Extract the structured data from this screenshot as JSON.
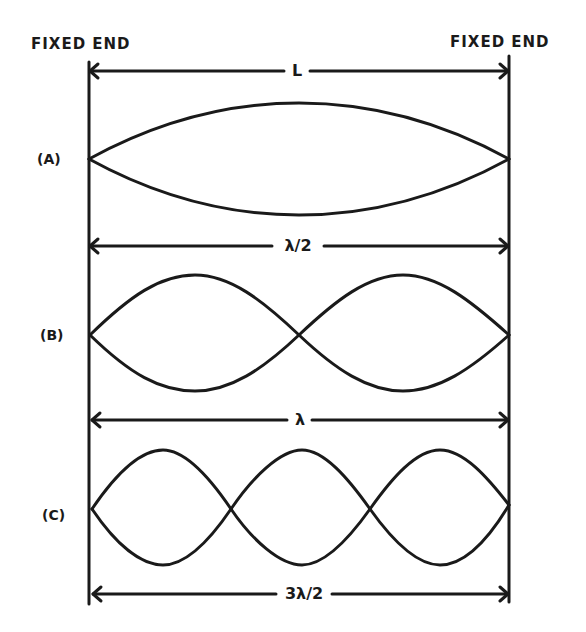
{
  "header": {
    "left_label": "FIXED END",
    "right_label": "FIXED END"
  },
  "string_length": {
    "label": "L"
  },
  "modes": [
    {
      "id": "A",
      "label": "(A)",
      "loops": 1,
      "dimension_label": "λ/2"
    },
    {
      "id": "B",
      "label": "(B)",
      "loops": 2,
      "dimension_label": "λ"
    },
    {
      "id": "C",
      "label": "(C)",
      "loops": 3,
      "dimension_label": "3λ/2"
    }
  ],
  "colors": {
    "ink": "#1a1a1a",
    "background": "#ffffff"
  }
}
